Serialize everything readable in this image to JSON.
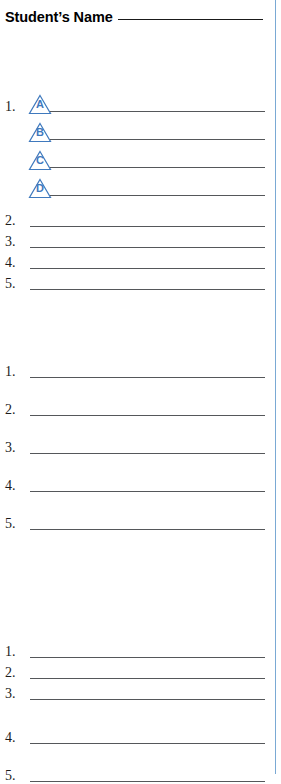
{
  "page": {
    "header": {
      "label": "Student’s Name",
      "rule": "blank-write-in-line"
    },
    "accent_color": "#3f79bd",
    "rule_color": "#55575a",
    "edge_rule_color": "#7aa9d4"
  },
  "sections": [
    {
      "name": "section-one",
      "rows": [
        {
          "number": "1.",
          "marker": "A",
          "line": true,
          "offset": 0
        },
        {
          "number": "",
          "marker": "B",
          "line": true,
          "offset": 28
        },
        {
          "number": "",
          "marker": "C",
          "line": true,
          "offset": 56
        },
        {
          "number": "",
          "marker": "D",
          "line": true,
          "offset": 84
        },
        {
          "number": "2.",
          "marker": "",
          "line": true,
          "offset": 114
        },
        {
          "number": "3.",
          "marker": "",
          "line": true,
          "offset": 135
        },
        {
          "number": "4.",
          "marker": "",
          "line": true,
          "offset": 156
        },
        {
          "number": "5.",
          "marker": "",
          "line": true,
          "offset": 177
        }
      ]
    },
    {
      "name": "section-two",
      "rows": [
        {
          "number": "1.",
          "marker": "",
          "line": true,
          "offset": 0
        },
        {
          "number": "2.",
          "marker": "",
          "line": true,
          "offset": 38
        },
        {
          "number": "3.",
          "marker": "",
          "line": true,
          "offset": 76
        },
        {
          "number": "4.",
          "marker": "",
          "line": true,
          "offset": 114
        },
        {
          "number": "5.",
          "marker": "",
          "line": true,
          "offset": 152
        }
      ]
    },
    {
      "name": "section-three",
      "rows": [
        {
          "number": "1.",
          "marker": "",
          "line": true,
          "offset": 0
        },
        {
          "number": "2.",
          "marker": "",
          "line": true,
          "offset": 21
        },
        {
          "number": "3.",
          "marker": "",
          "line": true,
          "offset": 42
        },
        {
          "number": "4.",
          "marker": "",
          "line": true,
          "offset": 86
        },
        {
          "number": "5.",
          "marker": "",
          "line": true,
          "offset": 124
        }
      ]
    }
  ]
}
